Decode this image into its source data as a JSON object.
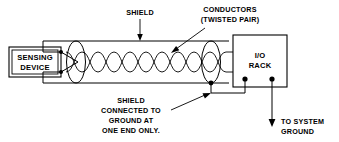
{
  "diagram": {
    "background_color": "#ffffff",
    "line_color": "#000000"
  },
  "labels": {
    "shield": "SHIELD",
    "conductors_line1": "CONDUCTORS",
    "conductors_line2": "(TWISTED PAIR)",
    "note_line1": "SHIELD",
    "note_line2": "CONNECTED TO",
    "note_line3": "GROUND AT",
    "note_line4": "ONE END ONLY.",
    "ground_line1": "TO SYSTEM",
    "ground_line2": "GROUND"
  },
  "components": {
    "sensing_device": {
      "line1": "SENSING",
      "line2": "DEVICE"
    },
    "io_rack": {
      "line1": "I/O",
      "line2": "RACK"
    }
  }
}
